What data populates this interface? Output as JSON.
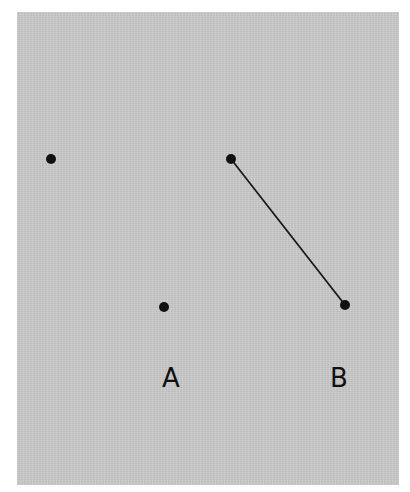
{
  "figure": {
    "background_color": "#c9c9c9",
    "ink_color": "#111111",
    "points": [
      {
        "id": "p1",
        "x": 51,
        "y": 159
      },
      {
        "id": "a",
        "x": 164,
        "y": 307
      },
      {
        "id": "b1",
        "x": 231,
        "y": 159
      },
      {
        "id": "b2",
        "x": 345,
        "y": 305
      }
    ],
    "segments": [
      {
        "from": "b1",
        "to": "b2"
      }
    ],
    "labels": {
      "a": "A",
      "b": "B"
    }
  }
}
